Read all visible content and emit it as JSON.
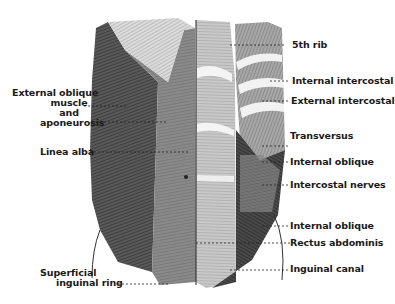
{
  "figure": {
    "labels_left": [
      {
        "id": "external-oblique",
        "lines": [
          "External oblique",
          "muscle",
          "and",
          "aponeurosis"
        ]
      },
      {
        "id": "linea-alba",
        "lines": [
          "Linea alba"
        ]
      },
      {
        "id": "superficial-inguinal-ring",
        "lines": [
          "Superficial",
          "inguinal ring"
        ]
      }
    ],
    "labels_right": [
      {
        "id": "5th-rib",
        "text": "5th rib"
      },
      {
        "id": "internal-intercostal",
        "text": "Internal intercostal"
      },
      {
        "id": "external-intercostal",
        "text": "External intercostal"
      },
      {
        "id": "transversus",
        "text": "Transversus"
      },
      {
        "id": "internal-oblique-upper",
        "text": "Internal oblique"
      },
      {
        "id": "intercostal-nerves",
        "text": "Intercostal nerves"
      },
      {
        "id": "internal-oblique-lower",
        "text": "Internal oblique"
      },
      {
        "id": "rectus-abdominis",
        "text": "Rectus abdominis"
      },
      {
        "id": "inguinal-canal",
        "text": "Inguinal canal"
      }
    ]
  }
}
